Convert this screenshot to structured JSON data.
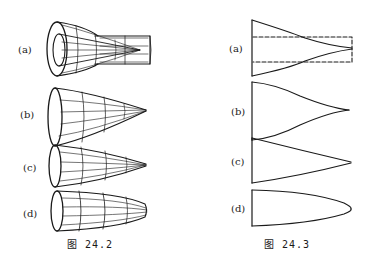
{
  "figures": [
    {
      "id": "fig-24-2",
      "caption": "图  24.2",
      "panels": [
        {
          "label": "(a)"
        },
        {
          "label": "(b)"
        },
        {
          "label": "(c)"
        },
        {
          "label": "(d)"
        }
      ]
    },
    {
      "id": "fig-24-3",
      "caption": "图  24.3",
      "panels": [
        {
          "label": "(a)"
        },
        {
          "label": "(b)"
        },
        {
          "label": "(c)"
        },
        {
          "label": "(d)"
        }
      ]
    }
  ],
  "colors": {
    "ink": "#1a1a1a",
    "background": "#ffffff"
  }
}
